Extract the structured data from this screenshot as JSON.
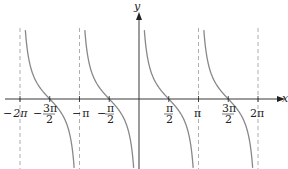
{
  "chart_data": {
    "type": "line",
    "title": "",
    "function": "y = cot(x)",
    "xlabel": "x",
    "ylabel": "y",
    "xlim": [
      -6.6,
      7.4
    ],
    "x_ticks": [
      {
        "value": -6.2832,
        "label": "-2π"
      },
      {
        "value": -4.7124,
        "label": "-3π/2"
      },
      {
        "value": -3.1416,
        "label": "-π"
      },
      {
        "value": -1.5708,
        "label": "-π/2"
      },
      {
        "value": 1.5708,
        "label": "π/2"
      },
      {
        "value": 3.1416,
        "label": "π"
      },
      {
        "value": 4.7124,
        "label": "3π/2"
      },
      {
        "value": 6.2832,
        "label": "2π"
      }
    ],
    "asymptotes": [
      -6.2832,
      -3.1416,
      0,
      3.1416,
      6.2832
    ],
    "zeros": [
      -4.7124,
      -1.5708,
      1.5708,
      4.7124
    ],
    "series": [
      {
        "name": "cot(x)",
        "branches": [
          [
            -6.2832,
            -3.1416
          ],
          [
            -3.1416,
            0
          ],
          [
            0,
            3.1416
          ],
          [
            3.1416,
            6.2832
          ]
        ]
      }
    ],
    "grid": false,
    "legend": "none",
    "colors": {
      "curve": "#888888",
      "axis": "#222222",
      "asymptote": "#999999"
    }
  },
  "labels": {
    "x_axis": "x",
    "y_axis": "y",
    "ticks": {
      "neg2pi": {
        "sign": "−",
        "num": "2π"
      },
      "neg3pi2": {
        "sign": "−",
        "num": "3π",
        "den": "2"
      },
      "negpi": {
        "sign": "−",
        "num": "π"
      },
      "negpi2": {
        "sign": "−",
        "num": "π",
        "den": "2"
      },
      "pi2": {
        "num": "π",
        "den": "2"
      },
      "pi": {
        "num": "π"
      },
      "threepi2": {
        "num": "3π",
        "den": "2"
      },
      "twopi": {
        "num": "2π"
      }
    }
  }
}
